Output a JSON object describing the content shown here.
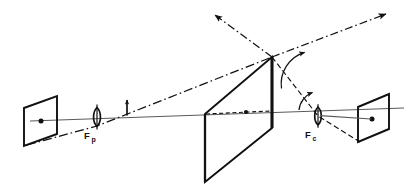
{
  "figure": {
    "background_color": "#ffffff",
    "ink_color": "#111111",
    "axis_color": "#555555",
    "width": 404,
    "height": 187
  },
  "labels": {
    "projector_lens": {
      "base": "F",
      "subscript": "p",
      "full": "Fp",
      "x": 91,
      "y": 131
    },
    "camera_lens": {
      "base": "F",
      "subscript": "c",
      "full": "Fc",
      "x": 313,
      "y": 130
    }
  },
  "elements": {
    "left_plane": {
      "name": "projector-image-plane",
      "kind": "parallelogram",
      "points": "24,108 57,96 57,134 24,146",
      "center_dot": {
        "x": 41,
        "y": 121,
        "r": 2.4
      }
    },
    "projector_lens": {
      "name": "projector-lens",
      "kind": "biconvex-lens",
      "cx": 97,
      "cy": 117,
      "rx": 4.2,
      "ry": 9.5
    },
    "object_arrow": {
      "name": "object-arrow",
      "kind": "vertical-arrow",
      "x": 127,
      "y_base": 114,
      "y_tip": 99
    },
    "center_plane": {
      "name": "tilted-screen-plane",
      "kind": "parallelogram",
      "points": "205,114 272,57 272,128 205,182"
    },
    "center_thick_edge": {
      "name": "screen-right-edge",
      "kind": "thick-line",
      "x1": 272,
      "y1": 57,
      "x2": 272,
      "y2": 128
    },
    "center_left_edge": {
      "name": "screen-left-edge",
      "kind": "thick-line",
      "x1": 205,
      "y1": 114,
      "x2": 205,
      "y2": 182
    },
    "camera_lens": {
      "name": "camera-lens",
      "kind": "biconvex-lens",
      "cx": 318,
      "cy": 116,
      "rx": 4.2,
      "ry": 9.0
    },
    "right_plane": {
      "name": "camera-sensor-plane",
      "kind": "parallelogram",
      "points": "358,107 389,94 389,129 358,142",
      "center_dot": {
        "x": 372,
        "y": 119,
        "r": 2.4
      }
    },
    "apex": {
      "name": "ray-apex",
      "x": 272,
      "y": 57
    }
  },
  "rays": {
    "optical_axis": {
      "name": "optical-axis",
      "style": "solid-thin",
      "x1": 30,
      "y1": 121,
      "x2": 404,
      "y2": 109
    },
    "chief_ray": {
      "name": "chief-ray-dash-dot",
      "style": "dash-dot",
      "points": "28,144 97,126 272,57"
    },
    "reflected_ray_upper_left": {
      "name": "reflected-ray-upper-left",
      "style": "dash-dot-arrow",
      "x1": 272,
      "y1": 57,
      "x2": 213,
      "y2": 13
    },
    "reflected_ray_upper_right": {
      "name": "reflected-ray-upper-right",
      "style": "dash-dot-arrow",
      "x1": 272,
      "y1": 57,
      "x2": 388,
      "y2": 13
    },
    "ray_to_camera": {
      "name": "ray-to-camera-lens",
      "style": "dash-dot",
      "points": "272,57 318,116 358,142"
    },
    "axis_to_sensor": {
      "name": "axis-through-camera-lens",
      "style": "solid-thin",
      "points": "318,116 358,107"
    },
    "inner_dashed_ray": {
      "name": "inner-dashed-axis-segment",
      "style": "short-dash",
      "x1": 205,
      "y1": 114,
      "x2": 272,
      "y2": 110,
      "dot": {
        "x": 246,
        "y": 111,
        "r": 2.0
      }
    },
    "plane_normal": {
      "name": "plane-normal-line",
      "style": "solid-thin",
      "x1": 272,
      "y1": 57,
      "x2": 272,
      "y2": 128
    }
  },
  "angles": {
    "apex_angle": {
      "name": "apex-angle-arc",
      "cx": 272,
      "cy": 57,
      "r": 33,
      "start_deg": -72,
      "end_deg": -8,
      "arrow_at": "start"
    },
    "axis_angle": {
      "name": "axis-angle-arc",
      "cx": 300,
      "cy": 110,
      "r": 22,
      "start_deg": -55,
      "end_deg": -2,
      "arrow_at": "start"
    }
  }
}
